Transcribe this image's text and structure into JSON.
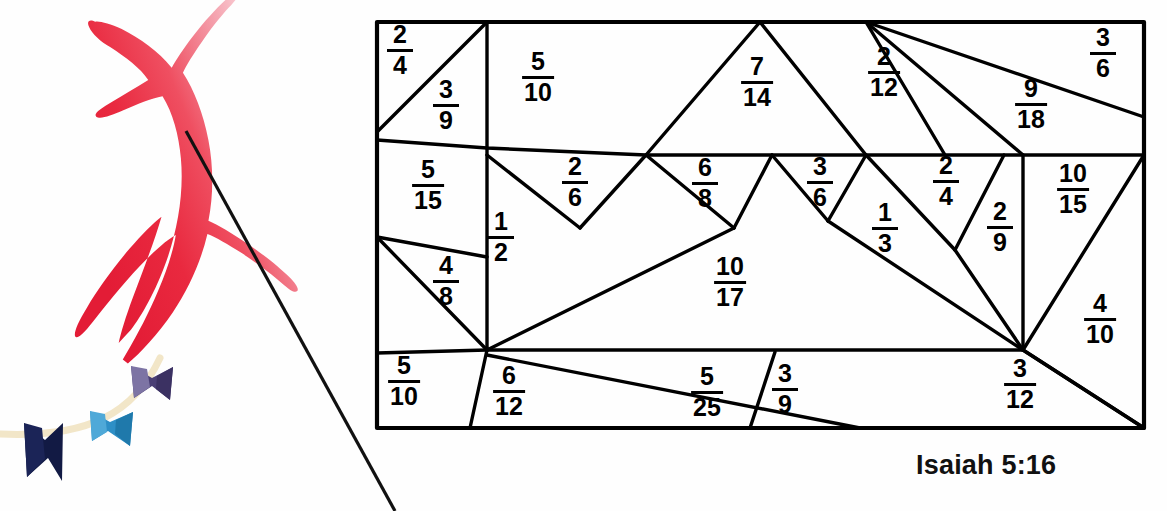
{
  "page": {
    "width": 1167,
    "height": 511,
    "background": "#ffffff"
  },
  "illustration": {
    "name": "kite-illustration",
    "kite": {
      "label": "red-kite",
      "color_start": "#e8213a",
      "color_mid": "#ed4458",
      "color_end": "#f9dde2"
    },
    "string": {
      "label": "kite-string",
      "color": "#111111"
    },
    "tail": {
      "label": "kite-tail",
      "color": "#f2e6c8",
      "ribbons": [
        {
          "name": "ribbon-purple",
          "color": "#4a3f75",
          "accent": "#7d74a4"
        },
        {
          "name": "ribbon-blue",
          "color": "#2e8fc6",
          "accent": "#1f77ad"
        },
        {
          "name": "ribbon-navy",
          "color": "#121a44",
          "accent": "#0d1233"
        }
      ]
    }
  },
  "puzzle": {
    "name": "fraction-dissection-puzzle",
    "frame": {
      "x": 377,
      "y": 22,
      "width": 767,
      "height": 406,
      "stroke": "#000000",
      "stroke_width": 4
    },
    "caption": "Isaiah 5:16",
    "cells": [
      {
        "id": "c1",
        "numerator": "2",
        "denominator": "4",
        "x": 400,
        "y": 50
      },
      {
        "id": "c2",
        "numerator": "3",
        "denominator": "9",
        "x": 446,
        "y": 105
      },
      {
        "id": "c3",
        "numerator": "5",
        "denominator": "10",
        "x": 538,
        "y": 77
      },
      {
        "id": "c4",
        "numerator": "7",
        "denominator": "14",
        "x": 757,
        "y": 82
      },
      {
        "id": "c5",
        "numerator": "2",
        "denominator": "12",
        "x": 884,
        "y": 72
      },
      {
        "id": "c6",
        "numerator": "9",
        "denominator": "18",
        "x": 1031,
        "y": 104
      },
      {
        "id": "c7",
        "numerator": "3",
        "denominator": "6",
        "x": 1103,
        "y": 53
      },
      {
        "id": "c8",
        "numerator": "5",
        "denominator": "15",
        "x": 428,
        "y": 185
      },
      {
        "id": "c9",
        "numerator": "2",
        "denominator": "6",
        "x": 575,
        "y": 182
      },
      {
        "id": "c10",
        "numerator": "6",
        "denominator": "8",
        "x": 705,
        "y": 183
      },
      {
        "id": "c11",
        "numerator": "3",
        "denominator": "6",
        "x": 820,
        "y": 182
      },
      {
        "id": "c12",
        "numerator": "2",
        "denominator": "4",
        "x": 946,
        "y": 181
      },
      {
        "id": "c13",
        "numerator": "10",
        "denominator": "15",
        "x": 1073,
        "y": 189
      },
      {
        "id": "c14",
        "numerator": "1",
        "denominator": "2",
        "x": 501,
        "y": 237
      },
      {
        "id": "c15",
        "numerator": "1",
        "denominator": "3",
        "x": 885,
        "y": 228
      },
      {
        "id": "c16",
        "numerator": "2",
        "denominator": "9",
        "x": 1000,
        "y": 227
      },
      {
        "id": "c17",
        "numerator": "4",
        "denominator": "8",
        "x": 446,
        "y": 281
      },
      {
        "id": "c18",
        "numerator": "10",
        "denominator": "17",
        "x": 730,
        "y": 282
      },
      {
        "id": "c19",
        "numerator": "4",
        "denominator": "10",
        "x": 1100,
        "y": 319
      },
      {
        "id": "c20",
        "numerator": "5",
        "denominator": "10",
        "x": 404,
        "y": 381
      },
      {
        "id": "c21",
        "numerator": "6",
        "denominator": "12",
        "x": 509,
        "y": 391
      },
      {
        "id": "c22",
        "numerator": "5",
        "denominator": "25",
        "x": 707,
        "y": 392
      },
      {
        "id": "c23",
        "numerator": "3",
        "denominator": "9",
        "x": 785,
        "y": 389
      },
      {
        "id": "c24",
        "numerator": "3",
        "denominator": "12",
        "x": 1020,
        "y": 384
      }
    ]
  }
}
